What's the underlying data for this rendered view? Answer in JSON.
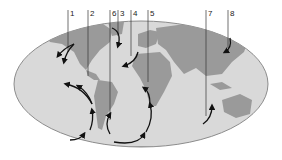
{
  "figure": {
    "type": "world map with ocean current arrows",
    "colors": {
      "ocean": "#d9d9d9",
      "land": "#9a9a9a",
      "outline": "#8c8c8c",
      "arrows": "#111111",
      "leader_lines": "#333333"
    },
    "labels": [
      {
        "id": "1",
        "text": "1",
        "x": 68
      },
      {
        "id": "2",
        "text": "2",
        "x": 88
      },
      {
        "id": "6",
        "text": "6",
        "x": 110
      },
      {
        "id": "3",
        "text": "3",
        "x": 118
      },
      {
        "id": "4",
        "text": "4",
        "x": 131
      },
      {
        "id": "5",
        "text": "5",
        "x": 148
      },
      {
        "id": "7",
        "text": "7",
        "x": 206
      },
      {
        "id": "8",
        "text": "8",
        "x": 228
      }
    ]
  }
}
